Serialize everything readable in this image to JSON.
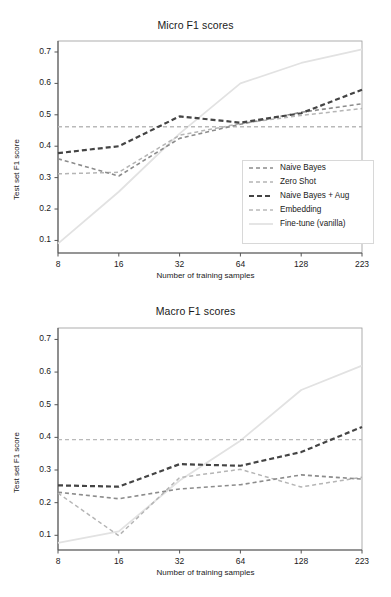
{
  "figure": {
    "panels": [
      "micro",
      "macro"
    ]
  },
  "legend": {
    "position": "lower-right-of-top-panel",
    "entries": [
      {
        "label": "Naive Bayes",
        "color": "#8c8c8c",
        "dash": "4,3",
        "width": 1.6,
        "name": "naive-bayes"
      },
      {
        "label": "Zero Shot",
        "color": "#b5b5b5",
        "dash": "4,3",
        "width": 1.5,
        "name": "zero-shot"
      },
      {
        "label": "Naive Bayes + Aug",
        "color": "#444444",
        "dash": "5,3",
        "width": 2.2,
        "name": "naive-bayes-aug"
      },
      {
        "label": "Embedding",
        "color": "#b9b9b9",
        "dash": "4,3",
        "width": 1.4,
        "name": "embedding"
      },
      {
        "label": "Fine-tune (vanilla)",
        "color": "#e2e2e2",
        "dash": "0",
        "width": 1.8,
        "name": "fine-tune-vanilla"
      }
    ]
  },
  "chart_data": [
    {
      "type": "line",
      "id": "micro",
      "title": "Micro F1 scores",
      "xlabel": "Number of training samples",
      "ylabel": "Test set F1 score",
      "categories": [
        "8",
        "16",
        "32",
        "64",
        "128",
        "223"
      ],
      "x": [
        8,
        16,
        32,
        64,
        128,
        223
      ],
      "ylim": [
        0.06,
        0.735
      ],
      "yticks": [
        "0.1",
        "0.2",
        "0.3",
        "0.4",
        "0.5",
        "0.6",
        "0.7"
      ],
      "ytick_values": [
        0.1,
        0.2,
        0.3,
        0.4,
        0.5,
        0.6,
        0.7
      ],
      "grid": false,
      "legend_position": "lower right",
      "series": [
        {
          "name": "Naive Bayes",
          "values": [
            0.36,
            0.305,
            0.425,
            0.47,
            0.508,
            0.535
          ]
        },
        {
          "name": "Zero Shot",
          "values": [
            0.312,
            0.317,
            0.435,
            0.472,
            0.498,
            0.52
          ]
        },
        {
          "name": "Naive Bayes + Aug",
          "values": [
            0.378,
            0.4,
            0.495,
            0.475,
            0.505,
            0.58
          ]
        },
        {
          "name": "Embedding",
          "values": [
            0.462,
            0.462,
            0.462,
            0.462,
            0.462,
            0.462
          ]
        },
        {
          "name": "Fine-tune (vanilla)",
          "values": [
            0.09,
            0.255,
            0.44,
            0.6,
            0.665,
            0.708
          ]
        }
      ]
    },
    {
      "type": "line",
      "id": "macro",
      "title": "Macro F1 scores",
      "xlabel": "Number of training samples",
      "ylabel": "Test set F1 score",
      "categories": [
        "8",
        "16",
        "32",
        "64",
        "128",
        "223"
      ],
      "x": [
        8,
        16,
        32,
        64,
        128,
        223
      ],
      "ylim": [
        0.055,
        0.735
      ],
      "yticks": [
        "0.1",
        "0.2",
        "0.3",
        "0.4",
        "0.5",
        "0.6",
        "0.7"
      ],
      "ytick_values": [
        0.1,
        0.2,
        0.3,
        0.4,
        0.5,
        0.6,
        0.7
      ],
      "grid": false,
      "legend_position": "none",
      "series": [
        {
          "name": "Naive Bayes",
          "values": [
            0.232,
            0.212,
            0.242,
            0.255,
            0.285,
            0.272
          ]
        },
        {
          "name": "Zero Shot",
          "values": [
            0.229,
            0.099,
            0.277,
            0.302,
            0.248,
            0.278
          ]
        },
        {
          "name": "Naive Bayes + Aug",
          "values": [
            0.253,
            0.249,
            0.318,
            0.313,
            0.355,
            0.432
          ]
        },
        {
          "name": "Embedding",
          "values": [
            0.393,
            0.393,
            0.393,
            0.393,
            0.393,
            0.393
          ]
        },
        {
          "name": "Fine-tune (vanilla)",
          "values": [
            0.077,
            0.112,
            0.268,
            0.39,
            0.545,
            0.62
          ]
        }
      ]
    }
  ],
  "style": {
    "axis_color": "#555555",
    "background": "#ffffff",
    "text_color": "#1a1a1a"
  }
}
